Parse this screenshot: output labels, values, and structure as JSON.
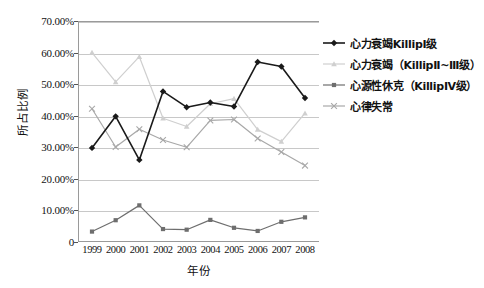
{
  "chart_data": {
    "type": "line",
    "title": "",
    "xlabel": "年份",
    "ylabel": "所占比例",
    "categories": [
      "1999",
      "2000",
      "2001",
      "2002",
      "2003",
      "2004",
      "2005",
      "2006",
      "2007",
      "2008"
    ],
    "x": [
      1999,
      2000,
      2001,
      2002,
      2003,
      2004,
      2005,
      2006,
      2007,
      2008
    ],
    "ylim": [
      0,
      70
    ],
    "ytick_labels": [
      "0",
      "10.00%",
      "20.00%",
      "30.00%",
      "40.00%",
      "50.00%",
      "60.00%",
      "70.00%"
    ],
    "ytick_values": [
      0,
      10,
      20,
      30,
      40,
      50,
      60,
      70
    ],
    "grid": true,
    "legend_position": "right",
    "series": [
      {
        "name": "心力衰竭KillipⅠ级",
        "marker": "diamond",
        "color": "#1a1a1a",
        "values": [
          29.8,
          39.8,
          26.0,
          47.7,
          42.7,
          44.2,
          42.9,
          57.0,
          55.6,
          45.6
        ]
      },
      {
        "name": "心力衰竭（KillipⅡ~Ⅲ级）",
        "marker": "triangle",
        "color": "#cfcfcf",
        "values": [
          60.0,
          50.7,
          58.7,
          39.2,
          36.6,
          43.8,
          45.4,
          35.6,
          31.8,
          40.8
        ]
      },
      {
        "name": "心源性休克（KillipⅣ级）",
        "marker": "square",
        "color": "#6e6e6e",
        "values": [
          3.3,
          6.9,
          11.6,
          4.1,
          3.9,
          7.0,
          4.5,
          3.5,
          6.4,
          7.8
        ]
      },
      {
        "name": "心律失常",
        "marker": "cross",
        "color": "#a8a8a8",
        "values": [
          42.2,
          30.1,
          35.7,
          32.3,
          30.0,
          38.5,
          38.8,
          32.8,
          28.5,
          24.2
        ]
      }
    ]
  },
  "legend": {
    "items": [
      {
        "label": "心力衰竭KillipⅠ级"
      },
      {
        "label": "心力衰竭（KillipⅡ~Ⅲ级）"
      },
      {
        "label": "心源性休克（KillipⅣ级）"
      },
      {
        "label": "心律失常"
      }
    ]
  },
  "axes": {
    "y_title": "所占比例",
    "x_title": "年份"
  }
}
